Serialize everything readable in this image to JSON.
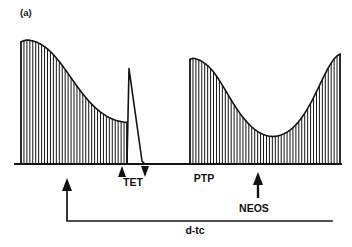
{
  "figure": {
    "panel_label": "(a)",
    "background_color": "#ffffff",
    "ink_color": "#141414"
  },
  "annotations": {
    "tet_label": "TET",
    "ptp_label": "PTP",
    "neos_label": "NEOS",
    "dtc_label": "d-tc"
  },
  "chart_data": {
    "type": "line",
    "title": "",
    "subtitle": "",
    "xlabel": "",
    "ylabel": "",
    "grid": false,
    "legend_position": "none",
    "axis_visible": "baseline-only",
    "xlim": [
      0,
      352
    ],
    "ylim": [
      0,
      1
    ],
    "baseline_y_px": 164,
    "series": [
      {
        "name": "twitch-burst-1-fade",
        "kind": "twitch-train",
        "x_start_px": 21,
        "x_end_px": 127,
        "n_twitches": 37,
        "envelope_note": "initial control height then progressive fade (d-tubocurarine onset)",
        "envelope_heights": [
          0.985,
          0.995,
          1.0,
          0.998,
          0.992,
          0.985,
          0.975,
          0.962,
          0.946,
          0.928,
          0.906,
          0.882,
          0.855,
          0.826,
          0.795,
          0.762,
          0.729,
          0.695,
          0.661,
          0.628,
          0.596,
          0.565,
          0.536,
          0.508,
          0.483,
          0.459,
          0.438,
          0.419,
          0.402,
          0.387,
          0.374,
          0.363,
          0.354,
          0.347,
          0.342,
          0.338,
          0.335
        ]
      },
      {
        "name": "tetanic-stimulus-spike",
        "kind": "spike",
        "x_rise_px": 127,
        "x_peak_px": 129,
        "peak_height": 0.77,
        "x_decay_end_px": 146,
        "note": "tetanus (TET) followed by decay to zero twitch height"
      },
      {
        "name": "flat-baseline-block",
        "kind": "flat",
        "x_start_px": 146,
        "x_end_px": 190,
        "height": 0.0,
        "note": "profound block, no twitch response"
      },
      {
        "name": "twitch-burst-2-ptp-and-recovery",
        "kind": "twitch-train",
        "x_start_px": 190,
        "x_end_px": 340,
        "n_twitches": 52,
        "envelope_note": "post-tetanic potentiation peak, secondary fade to trough, then neostigmine-induced recovery",
        "envelope_heights": [
          0.845,
          0.852,
          0.848,
          0.84,
          0.828,
          0.812,
          0.793,
          0.77,
          0.742,
          0.71,
          0.674,
          0.636,
          0.596,
          0.556,
          0.516,
          0.478,
          0.442,
          0.408,
          0.377,
          0.348,
          0.322,
          0.299,
          0.279,
          0.262,
          0.248,
          0.237,
          0.229,
          0.224,
          0.222,
          0.223,
          0.227,
          0.234,
          0.244,
          0.257,
          0.273,
          0.293,
          0.316,
          0.343,
          0.374,
          0.409,
          0.448,
          0.49,
          0.535,
          0.583,
          0.632,
          0.682,
          0.73,
          0.775,
          0.815,
          0.848,
          0.872,
          0.886
        ]
      }
    ],
    "events": [
      {
        "name": "TET",
        "label": "TET",
        "x_px": 133,
        "marker": "up-and-down-arrowheads",
        "meaning": "tetanic stimulation period"
      },
      {
        "name": "PTP",
        "label": "PTP",
        "x_px": 204,
        "marker": "text-only",
        "meaning": "post-tetanic potentiation"
      },
      {
        "name": "NEOS",
        "label": "NEOS",
        "x_px": 258,
        "marker": "up-arrow",
        "meaning": "neostigmine administration"
      },
      {
        "name": "d-tc",
        "label": "d-tc",
        "x_px": 67,
        "marker": "up-arrow-with-timeline",
        "timeline_x_start_px": 67,
        "timeline_x_end_px": 332,
        "meaning": "d-tubocurarine infusion period"
      }
    ]
  }
}
